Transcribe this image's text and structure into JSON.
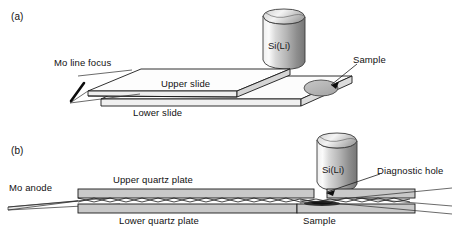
{
  "figure": {
    "background": "#ffffff",
    "width": 454,
    "height": 236
  },
  "colors": {
    "line": "#1a1a1a",
    "plate_fill": "#c9c9c9",
    "plate_top_fill": "#d7d7d7",
    "slide_face": "#ffffff",
    "slide_edge_fill": "#e8e8e8",
    "sample_fill": "#b3b3b3",
    "sample_dark": "#2e2e2e",
    "detector_light": "#f2f2f2",
    "detector_dark": "#6e6e6e",
    "text": "#111111"
  },
  "panel_a": {
    "tag": "(a)",
    "detector_label": "Si(Li)",
    "labels": {
      "mo_line_focus": "Mo line focus",
      "upper_slide": "Upper slide",
      "lower_slide": "Lower slide",
      "sample": "Sample"
    }
  },
  "panel_b": {
    "tag": "(b)",
    "detector_label": "Si(Li)",
    "labels": {
      "mo_anode": "Mo anode",
      "upper_quartz_plate": "Upper quartz plate",
      "lower_quartz_plate": "Lower quartz plate",
      "diagnostic_hole": "Diagnostic hole",
      "sample": "Sample"
    }
  }
}
